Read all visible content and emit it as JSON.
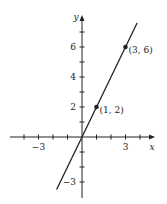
{
  "chart_data": {
    "type": "line",
    "title": "",
    "xlabel": "x",
    "ylabel": "y",
    "xlim": [
      -5.5,
      5
    ],
    "ylim": [
      -4,
      8
    ],
    "grid": false,
    "x_tick_labels": [
      {
        "value": -3,
        "label": "−3"
      },
      {
        "value": 3,
        "label": "3"
      }
    ],
    "y_tick_labels": [
      {
        "value": 2,
        "label": "2"
      },
      {
        "value": 4,
        "label": "4"
      },
      {
        "value": 6,
        "label": "6"
      },
      {
        "value": -3,
        "label": "−3"
      }
    ],
    "x_ticks": [
      -4,
      -3,
      -2,
      -1,
      1,
      2,
      3,
      4
    ],
    "y_ticks": [
      -3,
      -2,
      -1,
      1,
      2,
      3,
      4,
      5,
      6,
      7
    ],
    "series": [
      {
        "name": "y = 2x",
        "x": [
          -1.75,
          3.8
        ],
        "y": [
          -3.5,
          7.6
        ]
      }
    ],
    "points": [
      {
        "x": 1,
        "y": 2,
        "label": "(1, 2)"
      },
      {
        "x": 3,
        "y": 6,
        "label": "(3, 6)"
      }
    ],
    "line_color": "#222222"
  }
}
